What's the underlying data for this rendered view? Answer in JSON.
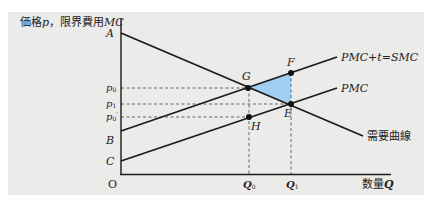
{
  "diagram": {
    "top_cutoff_text": "",
    "y_axis_label": "価格p，限界費用MC",
    "y_axis_label_parts": {
      "prefix": "価格",
      "p": "p",
      "sep": "，限界費用",
      "mc": "MC"
    },
    "x_axis_label_parts": {
      "prefix": "数量",
      "q": "Q"
    },
    "origin_label": "O",
    "y_intercepts": {
      "A": "A",
      "B": "B",
      "C": "C"
    },
    "price_ticks": [
      {
        "base": "p",
        "sub": "0",
        "prime": ""
      },
      {
        "base": "p",
        "sub": "1",
        "prime": ""
      },
      {
        "base": "p",
        "sub": "0",
        "prime": "′"
      }
    ],
    "quantity_ticks": [
      {
        "base": "Q",
        "sub": "0"
      },
      {
        "base": "Q",
        "sub": "1"
      }
    ],
    "points": {
      "G": "G",
      "F": "F",
      "E": "E",
      "H": "H"
    },
    "curves": {
      "smc": "PMC+t=SMC",
      "pmc": "PMC",
      "demand": "需要曲線"
    },
    "colors": {
      "panel_bg": "#ebebea",
      "line": "#1a1a1a",
      "dashed": "#555555",
      "deadweight_triangle": "#9fcff3"
    }
  }
}
